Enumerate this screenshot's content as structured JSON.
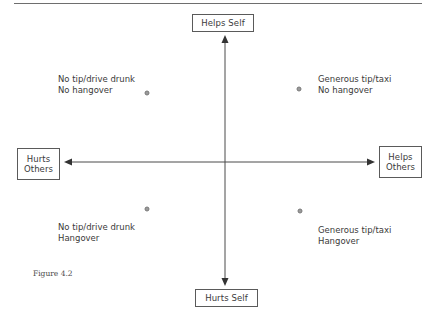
{
  "figure": {
    "caption": "Figure 4.2"
  },
  "axes": {
    "top_label": "Helps Self",
    "bottom_label": "Hurts Self",
    "left_label": [
      "Hurts",
      "Others"
    ],
    "right_label": [
      "Helps",
      "Others"
    ],
    "line_color": "#4a4a4a"
  },
  "quadrants": [
    {
      "id": "top-left",
      "lines": [
        "No tip/drive drunk",
        "No hangover"
      ],
      "point": {
        "x": 147,
        "y": 93
      }
    },
    {
      "id": "top-right",
      "lines": [
        "Generous tip/taxi",
        "No hangover"
      ],
      "point": {
        "x": 299,
        "y": 89
      }
    },
    {
      "id": "bottom-left",
      "lines": [
        "No tip/drive drunk",
        "Hangover"
      ],
      "point": {
        "x": 147,
        "y": 209
      }
    },
    {
      "id": "bottom-right",
      "lines": [
        "Generous tip/taxi",
        "Hangover"
      ],
      "point": {
        "x": 300,
        "y": 211
      }
    }
  ]
}
